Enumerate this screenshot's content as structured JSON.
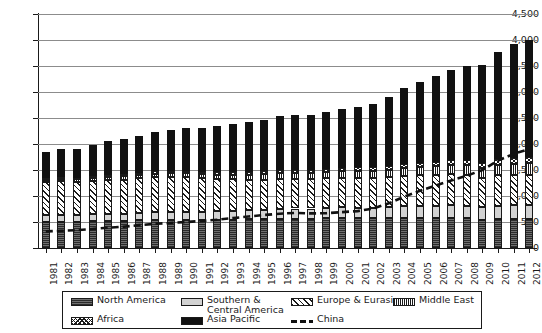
{
  "chart_data": {
    "type": "bar",
    "subtype": "stacked-bar-with-line-overlay",
    "title": "",
    "xlabel": "",
    "ylabel": "",
    "ylim": [
      0,
      4500
    ],
    "ytick_step": 500,
    "ytick_labels": [
      "0",
      "500",
      "1,000",
      "1,500",
      "2,000",
      "2,500",
      "3,000",
      "3,500",
      "4,000",
      "4,500"
    ],
    "ytick_values": [
      0,
      500,
      1000,
      1500,
      2000,
      2500,
      3000,
      3500,
      4000,
      4500
    ],
    "grid": true,
    "legend_position": "bottom",
    "categories": [
      "1981",
      "1982",
      "1983",
      "1984",
      "1985",
      "1986",
      "1987",
      "1988",
      "1989",
      "1990",
      "1991",
      "1992",
      "1993",
      "1994",
      "1995",
      "1996",
      "1997",
      "1998",
      "1999",
      "2000",
      "2001",
      "2002",
      "2003",
      "2004",
      "2005",
      "2006",
      "2007",
      "2008",
      "2009",
      "2010",
      "2011",
      "2012"
    ],
    "series": [
      {
        "name": "North America",
        "pattern": "dark-horizontal-hatch",
        "values": [
          500,
          505,
          500,
          515,
          520,
          520,
          530,
          540,
          540,
          540,
          535,
          540,
          545,
          550,
          555,
          560,
          565,
          560,
          570,
          575,
          570,
          570,
          575,
          585,
          585,
          580,
          585,
          570,
          545,
          560,
          560,
          565
        ]
      },
      {
        "name": "Southern & Central America",
        "pattern": "light-grey-solid",
        "values": [
          130,
          130,
          130,
          135,
          135,
          140,
          145,
          150,
          155,
          160,
          165,
          170,
          175,
          180,
          185,
          190,
          195,
          200,
          200,
          205,
          205,
          205,
          205,
          215,
          220,
          225,
          235,
          240,
          240,
          255,
          260,
          265
        ]
      },
      {
        "name": "Europe & Eurasia",
        "pattern": "diagonal-hatch",
        "values": [
          640,
          645,
          640,
          640,
          650,
          655,
          665,
          670,
          670,
          665,
          640,
          615,
          600,
          585,
          575,
          580,
          575,
          570,
          570,
          575,
          575,
          575,
          580,
          590,
          590,
          595,
          595,
          595,
          560,
          580,
          580,
          575
        ]
      },
      {
        "name": "Middle East",
        "pattern": "dense-vertical-hatch",
        "values": [
          45,
          48,
          50,
          55,
          58,
          62,
          66,
          70,
          74,
          78,
          82,
          86,
          90,
          95,
          100,
          105,
          110,
          115,
          120,
          125,
          130,
          138,
          146,
          155,
          163,
          172,
          180,
          190,
          196,
          205,
          215,
          225
        ]
      },
      {
        "name": "Africa",
        "pattern": "dotted-diamond",
        "values": [
          30,
          32,
          33,
          35,
          36,
          38,
          40,
          42,
          44,
          46,
          48,
          50,
          52,
          55,
          58,
          60,
          62,
          64,
          66,
          68,
          70,
          73,
          76,
          80,
          84,
          88,
          92,
          96,
          98,
          103,
          108,
          112
        ]
      },
      {
        "name": "Asia Pacific",
        "pattern": "solid-black",
        "values": [
          510,
          545,
          560,
          600,
          655,
          675,
          715,
          760,
          790,
          815,
          840,
          880,
          930,
          960,
          985,
          1035,
          1055,
          1040,
          1090,
          1125,
          1160,
          1215,
          1330,
          1460,
          1545,
          1640,
          1730,
          1800,
          1890,
          2075,
          2195,
          2265
        ]
      }
    ],
    "line_series": {
      "name": "China",
      "style": "dashed-black",
      "values": [
        320,
        330,
        345,
        365,
        390,
        410,
        440,
        465,
        480,
        500,
        520,
        545,
        575,
        605,
        635,
        660,
        675,
        665,
        670,
        690,
        710,
        760,
        860,
        990,
        1100,
        1200,
        1300,
        1390,
        1500,
        1680,
        1810,
        1900
      ]
    },
    "totals": [
      1855,
      1905,
      1913,
      1980,
      2054,
      2090,
      2161,
      2232,
      2273,
      2304,
      2310,
      2341,
      2392,
      2425,
      2458,
      2530,
      2562,
      2549,
      2616,
      2673,
      2710,
      2776,
      2912,
      3085,
      3187,
      3300,
      3417,
      3491,
      3529,
      3778,
      3918,
      4007
    ]
  },
  "legend": {
    "items": [
      {
        "label": "North America",
        "pattern": "dark-horizontal-hatch"
      },
      {
        "label": "Southern &\nCentral America",
        "pattern": "light-grey-solid"
      },
      {
        "label": "Europe & Eurasia",
        "pattern": "diagonal-hatch"
      },
      {
        "label": "Middle East",
        "pattern": "dense-vertical-hatch"
      },
      {
        "label": "Africa",
        "pattern": "dotted-diamond"
      },
      {
        "label": "Asia Pacific",
        "pattern": "solid-black"
      },
      {
        "label": "China",
        "pattern": "dashed-line"
      }
    ]
  },
  "colors": {
    "axis": "#1a1a1a",
    "grid": "#8c8c8c",
    "asia_pacific": "#111111",
    "southern_central_america": "#d2d2d2",
    "background": "#ffffff"
  }
}
